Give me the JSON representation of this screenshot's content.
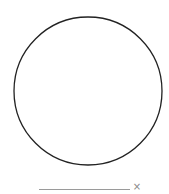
{
  "shape": {
    "type": "circle",
    "cx": 88,
    "cy": 91,
    "r": 74,
    "stroke": "#222222",
    "stroke_width": 1.3,
    "fill": "none"
  },
  "input": {
    "value": "",
    "clear_icon": "×"
  }
}
